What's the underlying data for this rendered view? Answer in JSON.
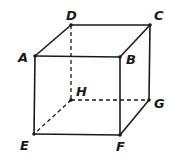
{
  "diagram": {
    "type": "cube",
    "vertices": [
      {
        "name": "A",
        "x": 35,
        "y": 56,
        "lx": 18,
        "ly": 62
      },
      {
        "name": "B",
        "x": 120,
        "y": 57,
        "lx": 126,
        "ly": 64
      },
      {
        "name": "C",
        "x": 150,
        "y": 25,
        "lx": 154,
        "ly": 20
      },
      {
        "name": "D",
        "x": 71,
        "y": 25,
        "lx": 66,
        "ly": 20
      },
      {
        "name": "E",
        "x": 34,
        "y": 134,
        "lx": 20,
        "ly": 150
      },
      {
        "name": "F",
        "x": 120,
        "y": 135,
        "lx": 116,
        "ly": 151
      },
      {
        "name": "G",
        "x": 149,
        "y": 100,
        "lx": 154,
        "ly": 108
      },
      {
        "name": "H",
        "x": 71,
        "y": 100,
        "lx": 76,
        "ly": 96
      }
    ],
    "solid_edges": [
      [
        "A",
        "B"
      ],
      [
        "A",
        "D"
      ],
      [
        "D",
        "C"
      ],
      [
        "B",
        "C"
      ],
      [
        "A",
        "E"
      ],
      [
        "B",
        "F"
      ],
      [
        "C",
        "G"
      ],
      [
        "E",
        "F"
      ],
      [
        "F",
        "G"
      ]
    ],
    "hidden_edges": [
      [
        "D",
        "H"
      ],
      [
        "H",
        "E"
      ],
      [
        "H",
        "G"
      ]
    ]
  }
}
